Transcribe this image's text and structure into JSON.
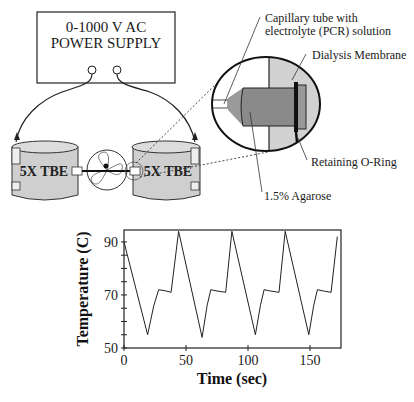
{
  "diagram": {
    "power_supply": {
      "line1": "0-1000 V AC",
      "line2": "POWER SUPPLY"
    },
    "reservoirs": {
      "left": "5X TBE",
      "right": "5X TBE"
    },
    "callouts": {
      "capillary_line1": "Capillary tube with",
      "capillary_line2": "electrolyte (PCR) solution",
      "dialysis": "Dialysis Membrane",
      "oring": "Retaining O-Ring",
      "agarose": "1.5% Agarose"
    },
    "colors": {
      "gray_fill": "#c8c8c8",
      "dark_gray": "#8a8a8a",
      "line": "#111111"
    }
  },
  "chart_data": {
    "type": "line",
    "title": "",
    "xlabel": "Time (sec)",
    "ylabel": "Temperature (C)",
    "xlim": [
      0,
      175
    ],
    "ylim": [
      50,
      94.5
    ],
    "xticks": [
      0,
      50,
      100,
      150
    ],
    "yticks": [
      50,
      70,
      90
    ],
    "y_minor_step": 5,
    "grid": false,
    "legend": null,
    "series": [
      {
        "name": "Temperature",
        "x": [
          0,
          19,
          24,
          28,
          34,
          38,
          44,
          63,
          67,
          70,
          75,
          82,
          87,
          106,
          110,
          113,
          118,
          125,
          130,
          149,
          153,
          156,
          161,
          167,
          172
        ],
        "y": [
          90,
          55,
          66,
          72,
          71.5,
          71,
          94,
          54,
          66,
          72,
          71.5,
          71,
          94,
          55,
          66,
          72,
          71.5,
          71,
          94,
          55,
          66,
          72,
          71.5,
          71,
          92
        ]
      }
    ]
  }
}
